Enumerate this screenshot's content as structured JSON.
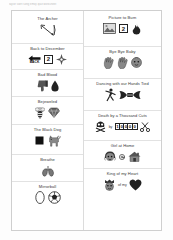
{
  "document": {
    "header_note": "taylor swift song emoji quiz worksheet"
  },
  "columns": [
    {
      "name": "left-column",
      "entries": [
        {
          "title": "The Archer",
          "glyphs": [
            {
              "icon": "bow-and-arrow-icon"
            }
          ]
        },
        {
          "title": "Back to December",
          "glyphs": [
            {
              "icon": "back-arrow-icon",
              "label": "BACK"
            },
            {
              "icon": "number-box-icon",
              "value": "2"
            },
            {
              "icon": "compass-rose-icon"
            }
          ]
        },
        {
          "title": "Bad Blood",
          "glyphs": [
            {
              "icon": "thumbs-down-icon"
            },
            {
              "icon": "blood-drop-icon"
            }
          ]
        },
        {
          "title": "Bejeweled",
          "glyphs": [
            {
              "icon": "bee-icon"
            },
            {
              "icon": "gem-icon"
            }
          ]
        },
        {
          "title": "The Black Dog",
          "glyphs": [
            {
              "icon": "black-square-icon"
            },
            {
              "icon": "dog-icon"
            }
          ]
        },
        {
          "title": "Breathe",
          "glyphs": [
            {
              "icon": "lungs-icon"
            }
          ]
        },
        {
          "title": "Mirrorball",
          "glyphs": [
            {
              "icon": "mirror-icon"
            },
            {
              "icon": "soccer-ball-icon"
            }
          ]
        }
      ]
    },
    {
      "name": "right-column",
      "entries": [
        {
          "title": "Picture to Burn",
          "glyphs": [
            {
              "icon": "picture-frame-icon"
            },
            {
              "icon": "number-box-icon",
              "value": "2"
            },
            {
              "icon": "fire-icon"
            }
          ]
        },
        {
          "title": "Bye Bye Baby",
          "glyphs": [
            {
              "icon": "waving-hand-icon"
            },
            {
              "icon": "waving-hand-icon"
            },
            {
              "icon": "baby-face-icon"
            }
          ]
        },
        {
          "title": "Dancing with our Hands Tied",
          "glyphs": [
            {
              "icon": "dancer-icon"
            },
            {
              "icon": "tied-hands-icon"
            }
          ]
        },
        {
          "title": "Death by a Thousand Cuts",
          "glyphs": [
            {
              "icon": "skull-and-crossbones-icon"
            },
            {
              "icon": "text-token",
              "value": "by"
            },
            {
              "icon": "odometer-icon",
              "value": "10000"
            },
            {
              "icon": "scissors-icon"
            }
          ]
        },
        {
          "title": "Girl at Home",
          "glyphs": [
            {
              "icon": "girl-face-icon"
            },
            {
              "icon": "at-sign-icon"
            },
            {
              "icon": "house-icon"
            }
          ]
        },
        {
          "title": "King of my Heart",
          "glyphs": [
            {
              "icon": "king-face-icon"
            },
            {
              "icon": "text-token",
              "value": "of my"
            },
            {
              "icon": "heart-icon"
            }
          ]
        }
      ]
    }
  ]
}
